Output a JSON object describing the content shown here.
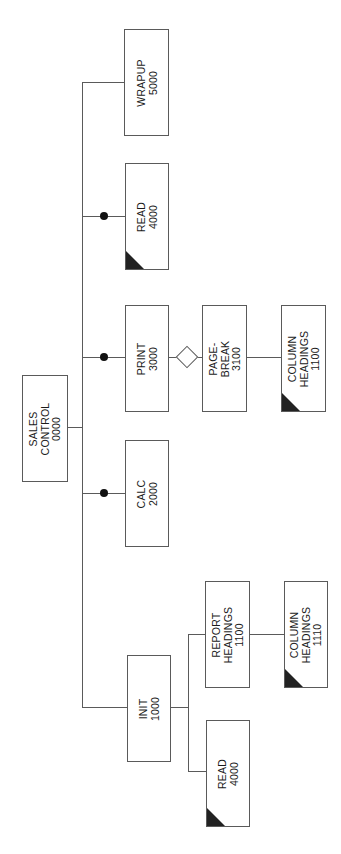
{
  "diagram": {
    "type": "structure-chart",
    "orientation": "rotated-90-ccw",
    "nodes": {
      "sales_control": {
        "line1": "SALES",
        "line2": "CONTROL",
        "line3": "0000"
      },
      "wrapup": {
        "line1": "WRAPUP",
        "line2": "5000"
      },
      "read_main": {
        "line1": "READ",
        "line2": "4000",
        "predefined": true
      },
      "print": {
        "line1": "PRINT",
        "line2": "3000"
      },
      "page_break": {
        "line1": "PAGE-",
        "line2": "BREAK",
        "line3": "3100"
      },
      "col_head_1100": {
        "line1": "COLUMN",
        "line2": "HEADINGS",
        "line3": "1100",
        "predefined": true
      },
      "calc": {
        "line1": "CALC",
        "line2": "2000"
      },
      "init": {
        "line1": "INIT",
        "line2": "1000"
      },
      "report_head": {
        "line1": "REPORT",
        "line2": "HEADINGS",
        "line3": "1100"
      },
      "col_head_1110": {
        "line1": "COLUMN",
        "line2": "HEADINGS",
        "line3": "1110",
        "predefined": true
      },
      "read_init": {
        "line1": "READ",
        "line2": "4000",
        "predefined": true
      }
    },
    "edges": [
      {
        "from": "sales_control",
        "to": "wrapup"
      },
      {
        "from": "sales_control",
        "to": "read_main",
        "marker": "loop-dot"
      },
      {
        "from": "sales_control",
        "to": "print",
        "marker": "loop-dot"
      },
      {
        "from": "sales_control",
        "to": "calc",
        "marker": "loop-dot"
      },
      {
        "from": "sales_control",
        "to": "init"
      },
      {
        "from": "print",
        "to": "page_break",
        "marker": "decision-diamond"
      },
      {
        "from": "page_break",
        "to": "col_head_1100"
      },
      {
        "from": "init",
        "to": "report_head"
      },
      {
        "from": "init",
        "to": "read_init"
      },
      {
        "from": "report_head",
        "to": "col_head_1110"
      }
    ],
    "colors": {
      "line": "#5a5a5a",
      "text": "#1a1a1a",
      "marker": "#111111"
    }
  }
}
